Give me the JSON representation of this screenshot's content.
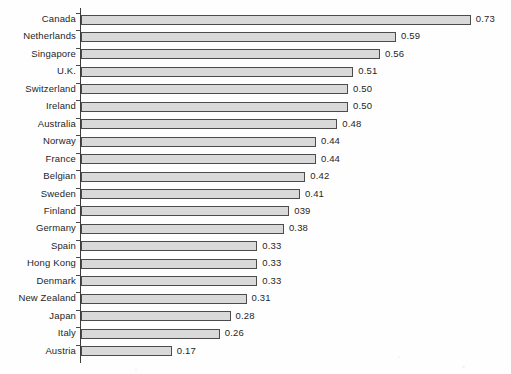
{
  "chart_data": {
    "type": "bar",
    "orientation": "horizontal",
    "title": "",
    "subtitle": "",
    "xlabel": "",
    "ylabel": "",
    "xlim": [
      0,
      0.78
    ],
    "grid": false,
    "legend": null,
    "categories": [
      "Canada",
      "Netherlands",
      "Singapore",
      "U.K.",
      "Switzerland",
      "Ireland",
      "Australia",
      "Norway",
      "France",
      "Belgian",
      "Sweden",
      "Finland",
      "Germany",
      "Spain",
      "Hong Kong",
      "Denmark",
      "New Zealand",
      "Japan",
      "Italy",
      "Austria"
    ],
    "values": [
      0.73,
      0.59,
      0.56,
      0.51,
      0.5,
      0.5,
      0.48,
      0.44,
      0.44,
      0.42,
      0.41,
      0.39,
      0.38,
      0.33,
      0.33,
      0.33,
      0.31,
      0.28,
      0.26,
      0.17
    ],
    "data_labels": [
      "0.73",
      "0.59",
      "0.56",
      "0.51",
      "0.50",
      "0.50",
      "0.48",
      "0.44",
      "0.44",
      "0.42",
      "0.41",
      "039",
      "0.38",
      "0.33",
      "0.33",
      "0.33",
      "0.31",
      "0.28",
      "0.26",
      "0.17"
    ],
    "colors": {
      "bar_fill": "#d9d9d9",
      "bar_border": "#4c4c4c",
      "axis": "#3d3d3d",
      "text": "#1f1f1f",
      "background": "#fefefe"
    }
  }
}
